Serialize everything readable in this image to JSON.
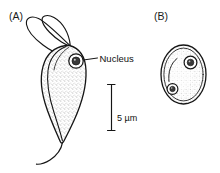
{
  "figure": {
    "background_color": "#ffffff",
    "ink_color": "#151515",
    "width": 220,
    "height": 173
  },
  "panels": [
    {
      "id": "A",
      "label": "(A)",
      "subject": "flagellate-trophozoite",
      "description": "pear-shaped stippled cell with anterior flagella and trailing posterior flagellum"
    },
    {
      "id": "B",
      "label": "(B)",
      "subject": "cyst",
      "description": "oval double-walled stippled cyst containing two nuclei and a curved axonemal remnant"
    }
  ],
  "annotations": [
    {
      "name": "nucleus",
      "label": "Nucleus",
      "panel": "A",
      "leader": true
    }
  ],
  "scale_bar": {
    "label": "5 µm",
    "value": 5,
    "unit": "µm",
    "orientation": "vertical",
    "end_caps": true
  },
  "structures": {
    "panel_a": {
      "nucleus_count": 1,
      "karyosome": true,
      "anterior_flagella": 2,
      "posterior_flagella": 1,
      "inner_membrane_ridge": true,
      "cytoplasm_texture": "stippled"
    },
    "panel_b": {
      "nucleus_count": 2,
      "karyosome": true,
      "wall": "double-contour",
      "internal_curve": true,
      "cytoplasm_texture": "stippled"
    }
  }
}
